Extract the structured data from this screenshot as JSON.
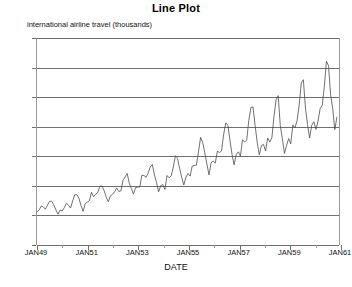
{
  "chart_data": {
    "type": "line",
    "title": "Line Plot",
    "ylabel": "international airline travel (thousands)",
    "xlabel": "DATE",
    "ylim": [
      0,
      700
    ],
    "y_ticks": [
      0,
      100,
      200,
      300,
      400,
      500,
      600,
      700
    ],
    "x_tick_labels": [
      "JAN49",
      "JAN51",
      "JAN53",
      "JAN55",
      "JAN57",
      "JAN59",
      "JAN61"
    ],
    "x_tick_values": [
      1949,
      1951,
      1953,
      1955,
      1957,
      1959,
      1961
    ],
    "xlim": [
      1949,
      1961
    ],
    "grid": true,
    "legend": false,
    "line_color": "#4d4d4d",
    "series": [
      {
        "name": "international airline travel (thousands)",
        "x": [
          1949.0,
          1949.0833,
          1949.1667,
          1949.25,
          1949.3333,
          1949.4167,
          1949.5,
          1949.5833,
          1949.6667,
          1949.75,
          1949.8333,
          1949.9167,
          1950.0,
          1950.0833,
          1950.1667,
          1950.25,
          1950.3333,
          1950.4167,
          1950.5,
          1950.5833,
          1950.6667,
          1950.75,
          1950.8333,
          1950.9167,
          1951.0,
          1951.0833,
          1951.1667,
          1951.25,
          1951.3333,
          1951.4167,
          1951.5,
          1951.5833,
          1951.6667,
          1951.75,
          1951.8333,
          1951.9167,
          1952.0,
          1952.0833,
          1952.1667,
          1952.25,
          1952.3333,
          1952.4167,
          1952.5,
          1952.5833,
          1952.6667,
          1952.75,
          1952.8333,
          1952.9167,
          1953.0,
          1953.0833,
          1953.1667,
          1953.25,
          1953.3333,
          1953.4167,
          1953.5,
          1953.5833,
          1953.6667,
          1953.75,
          1953.8333,
          1953.9167,
          1954.0,
          1954.0833,
          1954.1667,
          1954.25,
          1954.3333,
          1954.4167,
          1954.5,
          1954.5833,
          1954.6667,
          1954.75,
          1954.8333,
          1954.9167,
          1955.0,
          1955.0833,
          1955.1667,
          1955.25,
          1955.3333,
          1955.4167,
          1955.5,
          1955.5833,
          1955.6667,
          1955.75,
          1955.8333,
          1955.9167,
          1956.0,
          1956.0833,
          1956.1667,
          1956.25,
          1956.3333,
          1956.4167,
          1956.5,
          1956.5833,
          1956.6667,
          1956.75,
          1956.8333,
          1956.9167,
          1957.0,
          1957.0833,
          1957.1667,
          1957.25,
          1957.3333,
          1957.4167,
          1957.5,
          1957.5833,
          1957.6667,
          1957.75,
          1957.8333,
          1957.9167,
          1958.0,
          1958.0833,
          1958.1667,
          1958.25,
          1958.3333,
          1958.4167,
          1958.5,
          1958.5833,
          1958.6667,
          1958.75,
          1958.8333,
          1958.9167,
          1959.0,
          1959.0833,
          1959.1667,
          1959.25,
          1959.3333,
          1959.4167,
          1959.5,
          1959.5833,
          1959.6667,
          1959.75,
          1959.8333,
          1959.9167,
          1960.0,
          1960.0833,
          1960.1667,
          1960.25,
          1960.3333,
          1960.4167,
          1960.5,
          1960.5833,
          1960.6667,
          1960.75,
          1960.8333,
          1960.9167
        ],
        "values": [
          112,
          118,
          132,
          129,
          121,
          135,
          148,
          148,
          136,
          119,
          104,
          118,
          115,
          126,
          141,
          135,
          125,
          149,
          170,
          170,
          158,
          133,
          114,
          140,
          145,
          150,
          178,
          163,
          172,
          178,
          199,
          199,
          184,
          162,
          146,
          166,
          171,
          180,
          193,
          181,
          183,
          218,
          230,
          242,
          209,
          191,
          172,
          194,
          196,
          196,
          236,
          235,
          229,
          243,
          264,
          272,
          237,
          211,
          180,
          201,
          204,
          188,
          235,
          227,
          234,
          264,
          302,
          293,
          259,
          229,
          203,
          229,
          242,
          233,
          267,
          269,
          270,
          315,
          364,
          347,
          312,
          274,
          237,
          278,
          284,
          277,
          317,
          313,
          318,
          374,
          413,
          405,
          355,
          306,
          271,
          306,
          315,
          301,
          356,
          348,
          355,
          422,
          465,
          467,
          404,
          347,
          305,
          336,
          340,
          318,
          362,
          348,
          363,
          435,
          491,
          505,
          404,
          359,
          310,
          337,
          360,
          342,
          406,
          396,
          420,
          472,
          548,
          559,
          463,
          407,
          362,
          405,
          417,
          391,
          419,
          461,
          472,
          535,
          622,
          606,
          508,
          461,
          390,
          432
        ]
      }
    ]
  }
}
